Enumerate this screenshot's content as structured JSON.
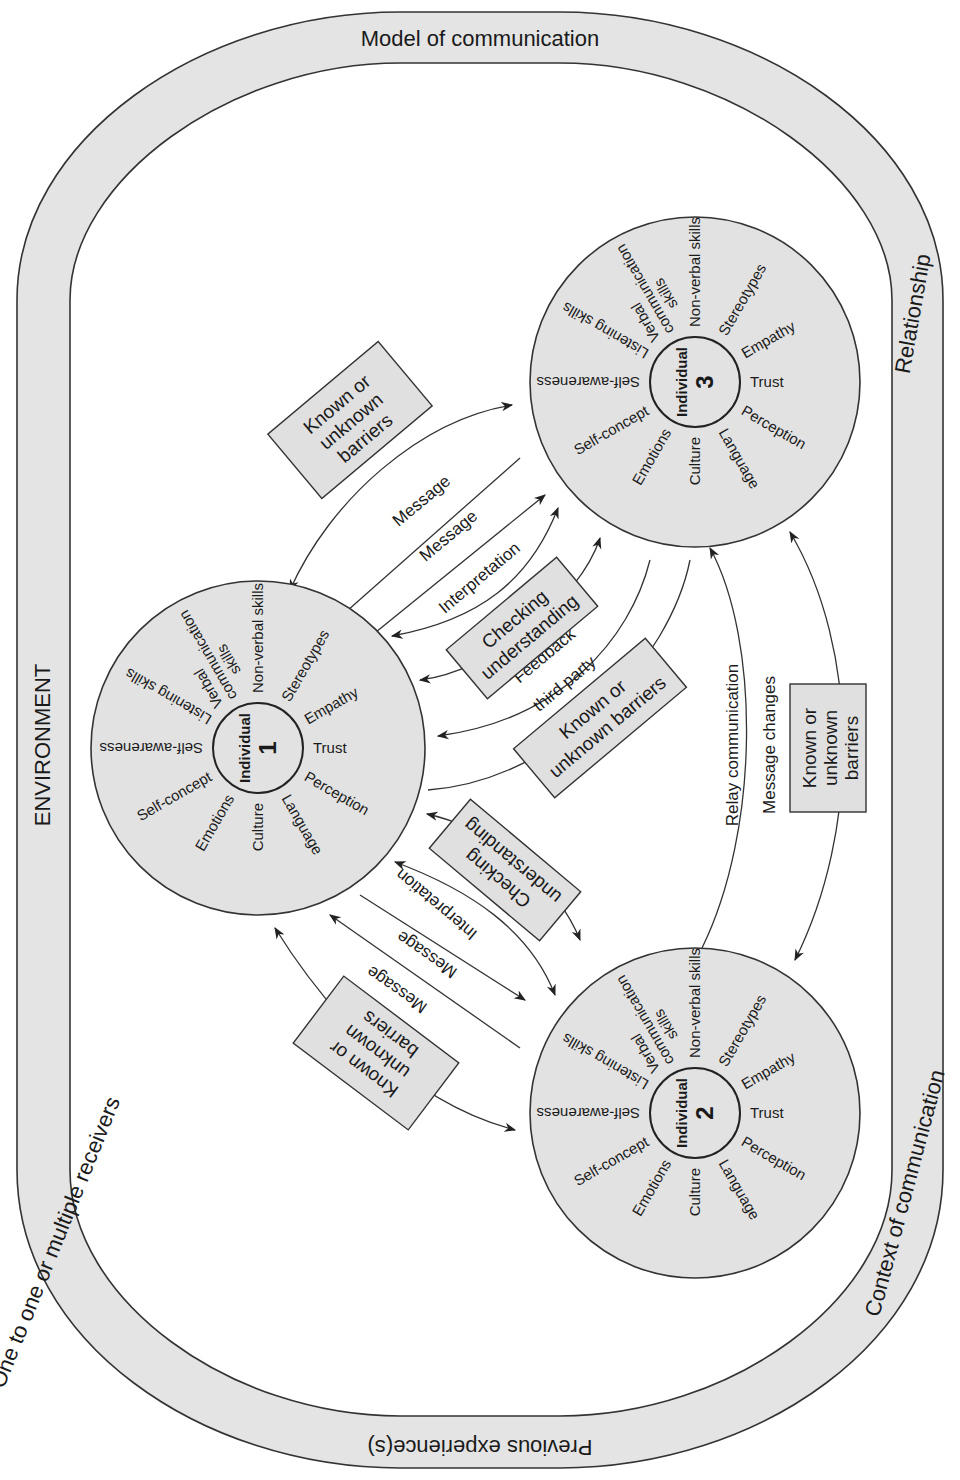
{
  "ring": {
    "top": "Model of communication",
    "left_top": "ENVIRONMENT",
    "left_bottom": "One to one or multiple receivers",
    "bottom": "Previous experience(s)",
    "right_top": "Relationship",
    "right_bottom": "Context of communication"
  },
  "individuals": [
    {
      "label": "Individual",
      "number": "1",
      "spokes": {
        "non_verbal": "Non-verbal skills",
        "stereotypes": "Stereotypes",
        "empathy": "Empathy",
        "trust": "Trust",
        "perception": "Perception",
        "language": "Language",
        "culture": "Culture",
        "emotions": "Emotions",
        "self_concept": "Self-concept",
        "self_awareness": "Self-awareness",
        "listening": "Listening skills",
        "verbal_1": "Verbal",
        "verbal_2": "communication",
        "verbal_3": "skills"
      }
    },
    {
      "label": "Individual",
      "number": "2",
      "spokes": {
        "non_verbal": "Non-verbal skills",
        "stereotypes": "Stereotypes",
        "empathy": "Empathy",
        "trust": "Trust",
        "perception": "Perception",
        "language": "Language",
        "culture": "Culture",
        "emotions": "Emotions",
        "self_concept": "Self-concept",
        "self_awareness": "Self-awareness",
        "listening": "Listening skills",
        "verbal_1": "Verbal",
        "verbal_2": "communication",
        "verbal_3": "skills"
      }
    },
    {
      "label": "Individual",
      "number": "3",
      "spokes": {
        "non_verbal": "Non-verbal skills",
        "stereotypes": "Stereotypes",
        "empathy": "Empathy",
        "trust": "Trust",
        "perception": "Perception",
        "language": "Language",
        "culture": "Culture",
        "emotions": "Emotions",
        "self_concept": "Self-concept",
        "self_awareness": "Self-awareness",
        "listening": "Listening skills",
        "verbal_1": "Verbal",
        "verbal_2": "communication",
        "verbal_3": "skills"
      }
    }
  ],
  "boxes": {
    "barriers_1_3": [
      "Known or",
      "unknown",
      "barriers"
    ],
    "checking_1_3": [
      "Checking",
      "understanding"
    ],
    "barriers_third_party": [
      "Known or",
      "unknown barriers"
    ],
    "checking_1_2": [
      "Checking",
      "understanding"
    ],
    "barriers_1_2": [
      "Known or",
      "unknown",
      "barriers"
    ],
    "barriers_2_3": [
      "Known or",
      "unknown",
      "barriers"
    ]
  },
  "edges": {
    "message_a_1_3": "Message",
    "message_b_1_3": "Message",
    "interpretation_1_3": "Interpretation",
    "feedback": "Feedback",
    "third_party": "third party",
    "message_a_1_2": "Message",
    "message_b_1_2": "Message",
    "interpretation_1_2": "Interpretation",
    "relay": "Relay communication",
    "message_changes": "Message changes"
  },
  "colors": {
    "fill_gray": "#e2e2e2",
    "stroke": "#333333",
    "background": "#ffffff"
  }
}
